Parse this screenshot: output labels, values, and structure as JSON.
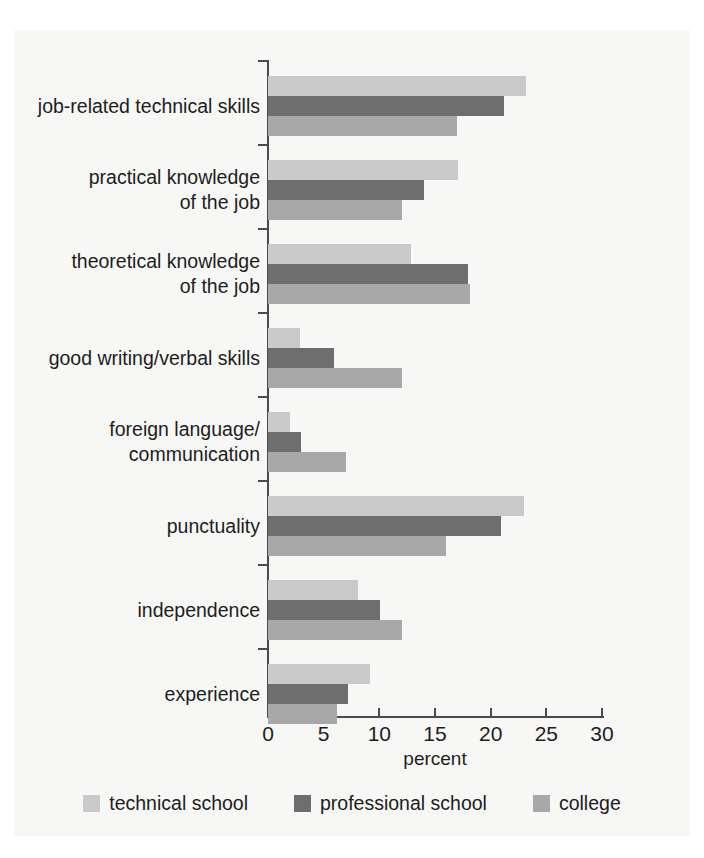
{
  "chart_data": {
    "type": "bar",
    "orientation": "horizontal",
    "title": "",
    "xlabel": "percent",
    "ylabel": "",
    "xlim": [
      0,
      30
    ],
    "xticks": [
      0,
      5,
      10,
      15,
      20,
      25,
      30
    ],
    "xtick_labels": [
      "0",
      "5",
      "10",
      "15",
      "20",
      "25",
      "30"
    ],
    "grid": false,
    "legend_position": "bottom",
    "categories": [
      "job-related technical skills",
      "practical knowledge\nof the job",
      "theoretical knowledge\nof the job",
      "good writing/verbal skills",
      "foreign language/\ncommunication",
      "punctuality",
      "independence",
      "experience"
    ],
    "series": [
      {
        "name": "technical school",
        "color": "#c9c9c9",
        "values": [
          23.2,
          17.1,
          12.8,
          2.9,
          2.0,
          23.0,
          8.1,
          9.2
        ]
      },
      {
        "name": "professional school",
        "color": "#6e6e6e",
        "values": [
          21.2,
          14.0,
          18.0,
          5.9,
          3.0,
          20.9,
          10.1,
          7.2
        ]
      },
      {
        "name": "college",
        "color": "#a8a8a8",
        "values": [
          17.0,
          12.0,
          18.1,
          12.0,
          7.0,
          16.0,
          12.0,
          6.2
        ]
      }
    ]
  },
  "legend": {
    "items": [
      {
        "label": "technical school",
        "color": "#c9c9c9"
      },
      {
        "label": "professional school",
        "color": "#6e6e6e"
      },
      {
        "label": "college",
        "color": "#a8a8a8"
      }
    ]
  },
  "axis": {
    "x_title": "percent"
  },
  "colors": {
    "plot_background": "#f7f7f5",
    "page_background": "#ffffff",
    "axis": "#4a4a4a",
    "text": "#1d1d1d"
  }
}
